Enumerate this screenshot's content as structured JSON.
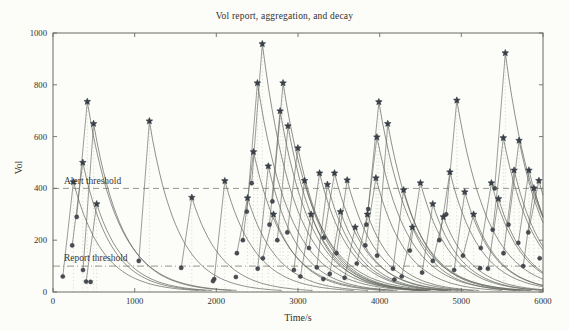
{
  "chart_data": {
    "type": "line",
    "title": "Vol report, aggregation, and decay",
    "xlabel": "Time/s",
    "ylabel": "Vol",
    "xlim": [
      0,
      6000
    ],
    "ylim": [
      0,
      1000
    ],
    "xticks": [
      0,
      1000,
      2000,
      3000,
      4000,
      5000,
      6000
    ],
    "yticks": [
      0,
      200,
      400,
      600,
      800,
      1000
    ],
    "grid": false,
    "legend": "none",
    "thresholds": [
      {
        "name": "alert",
        "label": "Alert threshold",
        "value": 400,
        "line_style": "dashed"
      },
      {
        "name": "report",
        "label": "Report threshold",
        "value": 100,
        "line_style": "dash-dot"
      }
    ],
    "model": "each event: vol jumps (aggregation) to peak marked by star, then decays as v(t)=peak*exp(-(t-t0)/tau); dot marks report point before aggregation; dotted vertical line at event time",
    "markers": {
      "star": "aggregated peak volume",
      "dot": "report point"
    },
    "events_fields": [
      "t",
      "peak_vol",
      "report_vol",
      "tau"
    ],
    "events": [
      [
        250,
        425,
        60,
        360
      ],
      [
        365,
        500,
        180,
        340
      ],
      [
        420,
        735,
        290,
        380
      ],
      [
        497,
        650,
        85,
        360
      ],
      [
        535,
        340,
        40,
        350
      ],
      [
        1180,
        660,
        120,
        345
      ],
      [
        1700,
        365,
        93,
        360
      ],
      [
        2104,
        429,
        50,
        370
      ],
      [
        2382,
        363,
        150,
        360
      ],
      [
        2455,
        541,
        200,
        380
      ],
      [
        2503,
        807,
        310,
        400
      ],
      [
        2563,
        958,
        420,
        390
      ],
      [
        2636,
        486,
        90,
        360
      ],
      [
        2700,
        300,
        130,
        350
      ],
      [
        2781,
        699,
        260,
        380
      ],
      [
        2817,
        807,
        350,
        400
      ],
      [
        2877,
        641,
        200,
        370
      ],
      [
        2999,
        556,
        230,
        360
      ],
      [
        3080,
        430,
        85,
        350
      ],
      [
        3160,
        300,
        60,
        340
      ],
      [
        3264,
        459,
        170,
        360
      ],
      [
        3360,
        415,
        95,
        350
      ],
      [
        3447,
        459,
        210,
        365
      ],
      [
        3520,
        310,
        70,
        345
      ],
      [
        3602,
        432,
        150,
        360
      ],
      [
        3700,
        250,
        55,
        340
      ],
      [
        3850,
        300,
        110,
        350
      ],
      [
        3954,
        440,
        180,
        360
      ],
      [
        3966,
        598,
        260,
        380
      ],
      [
        3990,
        734,
        320,
        390
      ],
      [
        4099,
        650,
        140,
        370
      ],
      [
        4293,
        394,
        90,
        350
      ],
      [
        4400,
        250,
        60,
        340
      ],
      [
        4499,
        421,
        160,
        360
      ],
      [
        4650,
        340,
        75,
        345
      ],
      [
        4780,
        290,
        120,
        350
      ],
      [
        4860,
        463,
        200,
        365
      ],
      [
        4945,
        740,
        300,
        390
      ],
      [
        5042,
        386,
        85,
        350
      ],
      [
        5150,
        300,
        140,
        345
      ],
      [
        5368,
        421,
        170,
        355
      ],
      [
        5455,
        360,
        90,
        350
      ],
      [
        5514,
        595,
        240,
        375
      ],
      [
        5538,
        923,
        400,
        395
      ],
      [
        5646,
        470,
        150,
        360
      ],
      [
        5707,
        585,
        260,
        375
      ],
      [
        5828,
        470,
        190,
        360
      ],
      [
        5888,
        401,
        100,
        350
      ],
      [
        5950,
        430,
        230,
        355
      ]
    ],
    "extra_dots": [
      [
        460,
        39
      ],
      [
        1959,
        42
      ],
      [
        2240,
        58
      ],
      [
        3310,
        50
      ],
      [
        4180,
        48
      ],
      [
        5230,
        92
      ],
      [
        5960,
        130
      ]
    ]
  },
  "colors": {
    "background": "#fcfcf9",
    "frame": "#6a6a64",
    "curve": "#63675e",
    "vertical_guide": "#bdbdb4",
    "threshold_line": "#8a8a83",
    "star_fill": "#3b4149",
    "star_stroke": "#2b3036",
    "dot_fill": "#484d53",
    "text": "#32302c"
  }
}
